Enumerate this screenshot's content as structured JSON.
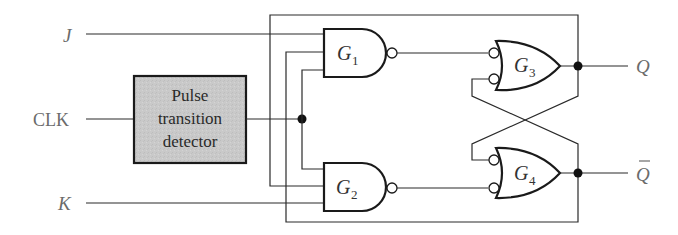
{
  "inputs": {
    "j_label": "J",
    "clk_label": "CLK",
    "k_label": "K"
  },
  "outputs": {
    "q_label": "Q",
    "qbar_label": "Q",
    "qbar_overline": true
  },
  "detector": {
    "line1": "Pulse",
    "line2": "transition",
    "line3": "detector",
    "fill_color": "#c8c8c8"
  },
  "gates": [
    {
      "id": "G1",
      "letter": "G",
      "sub": "1",
      "type": "NAND"
    },
    {
      "id": "G2",
      "letter": "G",
      "sub": "2",
      "type": "NAND"
    },
    {
      "id": "G3",
      "letter": "G",
      "sub": "3",
      "type": "OR with inverted inputs"
    },
    {
      "id": "G4",
      "letter": "G",
      "sub": "4",
      "type": "OR with inverted inputs"
    }
  ],
  "colors": {
    "label_gray": "#6b6b6b",
    "wire": "#2a2a2a",
    "box_fill": "#c8c8c8"
  }
}
